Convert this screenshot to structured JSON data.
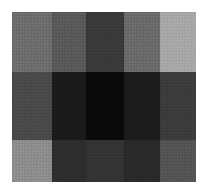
{
  "canvas": {
    "width": 209,
    "height": 194,
    "background": "#ffffff"
  },
  "grid": {
    "left": 12,
    "top": 12,
    "width": 184,
    "height": 170,
    "columns": 5,
    "rows": 3,
    "column_widths": [
      40,
      34,
      38,
      36,
      36
    ],
    "row_heights": [
      60,
      68,
      42
    ]
  },
  "chart_data": {
    "type": "heatmap",
    "title": "",
    "xlabel": "",
    "ylabel": "",
    "grid": false,
    "legend": "none",
    "columns": [
      "c1",
      "c2",
      "c3",
      "c4",
      "c5"
    ],
    "rows": [
      "r1",
      "r2",
      "r3"
    ],
    "colors": [
      [
        "#6e6e6e",
        "#5a5a5a",
        "#3a3a3a",
        "#6b6b6b",
        "#a8a8a8"
      ],
      [
        "#4a4a4a",
        "#1a1a1a",
        "#0a0a0a",
        "#1c1c1c",
        "#3c3c3c"
      ],
      [
        "#8e8e8e",
        "#2e2e2e",
        "#343434",
        "#2a2a2a",
        "#545454"
      ]
    ],
    "values": [
      [
        110,
        90,
        58,
        107,
        168
      ],
      [
        74,
        26,
        10,
        28,
        60
      ],
      [
        142,
        46,
        52,
        42,
        84
      ]
    ],
    "vmin": 0,
    "vmax": 255
  }
}
